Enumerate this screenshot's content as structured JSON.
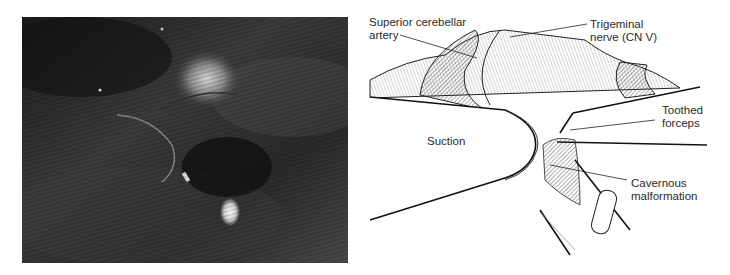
{
  "figure": {
    "photo": {
      "description": "Intraoperative microscope photograph",
      "tones": {
        "dark": "#1e1e1e",
        "mid": "#4a4a4a",
        "bright": "#e8e8e8"
      }
    },
    "illustration": {
      "description": "Labeled line drawing of surgical field",
      "labels": {
        "superior_cerebellar_artery": "Superior cerebellar\nartery",
        "trigeminal_nerve": "Trigeminal\nnerve (CN V)",
        "toothed_forceps": "Toothed\nforceps",
        "suction": "Suction",
        "cavernous_malformation": "Cavernous\nmalformation"
      },
      "line_color": "#1a1a1a"
    }
  }
}
